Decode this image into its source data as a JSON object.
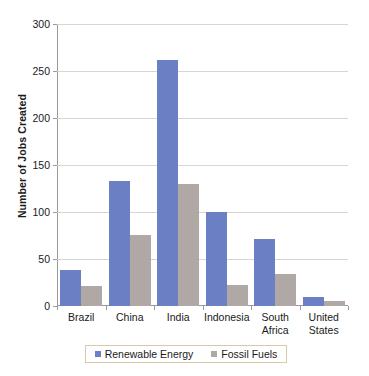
{
  "chart_data": {
    "type": "bar",
    "title": "",
    "xlabel": "",
    "ylabel": "Number of Jobs Created",
    "ylim": [
      0,
      300
    ],
    "ytick_labels": [
      "300",
      "250",
      "200",
      "150",
      "100",
      "50",
      "0"
    ],
    "ytick_values": [
      300,
      250,
      200,
      150,
      100,
      50,
      0
    ],
    "grid": true,
    "legend_position": "bottom",
    "categories": [
      "Brazil",
      "China",
      "India",
      "Indonesia",
      "South Africa",
      "United States"
    ],
    "category_lines": [
      [
        "Brazil"
      ],
      [
        "China"
      ],
      [
        "India"
      ],
      [
        "Indonesia"
      ],
      [
        "South",
        "Africa"
      ],
      [
        "United",
        "States"
      ]
    ],
    "series": [
      {
        "name": "Renewable Energy",
        "color": "#6B80C4",
        "values": [
          38,
          133,
          262,
          100,
          71,
          10
        ]
      },
      {
        "name": "Fossil Fuels",
        "color": "#B0A8A4",
        "values": [
          21,
          75,
          130,
          22,
          34,
          5
        ]
      }
    ]
  },
  "legend": {
    "entries": [
      {
        "label": "Renewable Energy"
      },
      {
        "label": "Fossil Fuels"
      }
    ]
  }
}
